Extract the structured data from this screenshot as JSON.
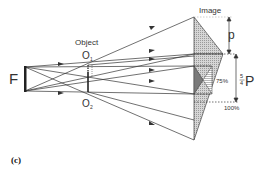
{
  "diagram": {
    "labels": {
      "filament": "F",
      "object": "Object",
      "o1": "O",
      "o1_sub": "1",
      "o2": "O",
      "o2_sub": "2",
      "image": "Image",
      "p": "p",
      "frac_num": "5",
      "frac_den": "4",
      "big_p": "P",
      "pct75": "75%",
      "pct100": "100%",
      "caption": "(c)"
    },
    "colors": {
      "line": "#333333",
      "shade": "#b8b8b8",
      "dark_shade": "#777777"
    }
  }
}
